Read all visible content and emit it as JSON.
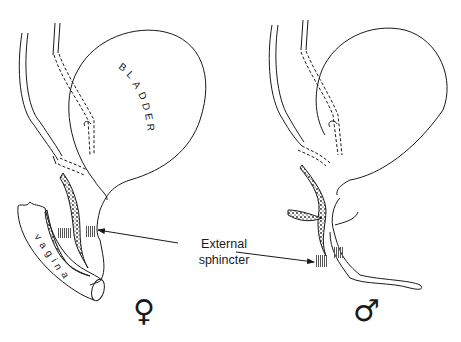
{
  "figure": {
    "panels": [
      {
        "id": "female",
        "symbol": "♀",
        "organ_label": "BLADDER",
        "secondary_label": "vagina"
      },
      {
        "id": "male",
        "symbol": "♂"
      }
    ],
    "callout": {
      "line1": "External",
      "line2": "sphincter"
    },
    "colors": {
      "stroke": "#1a1a1a",
      "background": "#ffffff",
      "hatch": "#555555"
    }
  }
}
